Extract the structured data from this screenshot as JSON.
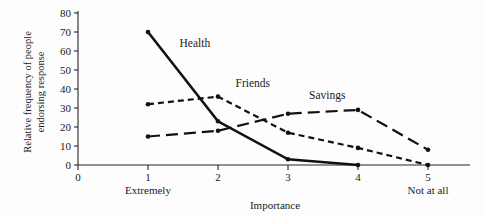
{
  "chart_data": {
    "type": "line",
    "title": "",
    "subtitle": "",
    "xlabel": "Importance",
    "ylabel": "Relative frequency of people endorsing response",
    "ylabel_line1": "Relative frequency of people",
    "ylabel_line2": "endorsing response",
    "x": [
      1,
      2,
      3,
      4,
      5
    ],
    "xlim": [
      0,
      5.6
    ],
    "ylim": [
      0,
      80
    ],
    "xticks": [
      0,
      1,
      2,
      3,
      4,
      5
    ],
    "xtick_labels": [
      "0",
      "1",
      "2",
      "3",
      "4",
      "5"
    ],
    "yticks": [
      0,
      10,
      20,
      30,
      40,
      50,
      60,
      70,
      80
    ],
    "ytick_labels": [
      "0",
      "10",
      "20",
      "30",
      "40",
      "50",
      "60",
      "70",
      "80"
    ],
    "grid": false,
    "legend_position": "inline-annotations",
    "anchor_labels": [
      {
        "at_x": 1,
        "text": "Extremely"
      },
      {
        "at_x": 5,
        "text": "Not at all"
      }
    ],
    "series": [
      {
        "name": "Health",
        "style": "solid",
        "x": [
          1,
          2,
          3,
          4
        ],
        "values": [
          70,
          23,
          3,
          0
        ],
        "label_x": 1.45,
        "label_y": 62
      },
      {
        "name": "Friends",
        "style": "short-dashed",
        "x": [
          1,
          2,
          3,
          4,
          5
        ],
        "values": [
          32,
          36,
          17,
          9,
          0
        ],
        "label_x": 2.25,
        "label_y": 41
      },
      {
        "name": "Savings",
        "style": "long-dashed",
        "x": [
          1,
          2,
          3,
          4,
          5
        ],
        "values": [
          15,
          18,
          27,
          29,
          8
        ],
        "label_x": 3.3,
        "label_y": 35
      }
    ],
    "colors": {
      "line": "#111111",
      "axis": "#262626",
      "text": "#1a1a1a",
      "background": "#fdfdfd"
    }
  }
}
